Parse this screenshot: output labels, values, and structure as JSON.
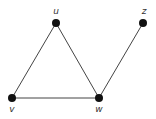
{
  "graph": {
    "nodes": [
      {
        "id": "u",
        "label": "u",
        "x": 56,
        "y": 23,
        "lx": 56,
        "ly": 14
      },
      {
        "id": "z",
        "label": "z",
        "x": 143,
        "y": 23,
        "lx": 144,
        "ly": 14
      },
      {
        "id": "v",
        "label": "v",
        "x": 12,
        "y": 98,
        "lx": 12,
        "ly": 112
      },
      {
        "id": "w",
        "label": "w",
        "x": 99,
        "y": 98,
        "lx": 99,
        "ly": 112
      }
    ],
    "edges": [
      {
        "from": "u",
        "to": "v"
      },
      {
        "from": "u",
        "to": "w"
      },
      {
        "from": "v",
        "to": "w"
      },
      {
        "from": "w",
        "to": "z"
      }
    ],
    "colors": {
      "node": "#111111",
      "edge": "#444444",
      "label": "#333333"
    }
  }
}
